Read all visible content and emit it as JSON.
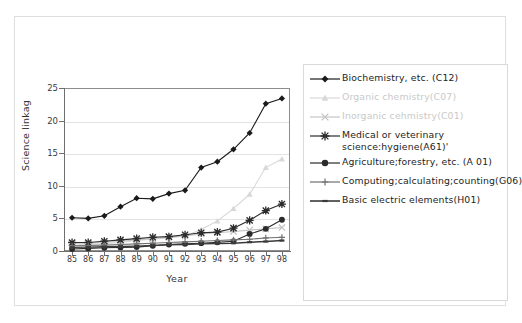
{
  "top_title_fragment": "",
  "chart_data": {
    "type": "line",
    "title": "",
    "xlabel": "Year",
    "ylabel": "Science linkag",
    "categories": [
      "85",
      "86",
      "87",
      "88",
      "89",
      "90",
      "91",
      "92",
      "93",
      "94",
      "95",
      "96",
      "97",
      "98"
    ],
    "ylim": [
      0,
      25
    ],
    "yticks": [
      0,
      5,
      10,
      15,
      20,
      25
    ],
    "grid": true,
    "legend_position": "right",
    "series": [
      {
        "name": "Biochemistry, etc. (C12)",
        "marker": "diamond",
        "color": "#1a1a1a",
        "values": [
          5.1,
          5.0,
          5.4,
          6.8,
          8.1,
          8.0,
          8.8,
          9.3,
          12.8,
          13.7,
          15.6,
          18.1,
          22.6,
          23.4
        ]
      },
      {
        "name": "Organic chemistry(C07)",
        "marker": "triangle",
        "color": "#d8d8d8",
        "values": [
          0.9,
          1.0,
          1.1,
          1.3,
          1.6,
          1.8,
          2.0,
          2.3,
          3.3,
          4.6,
          6.5,
          8.7,
          12.8,
          14.1
        ]
      },
      {
        "name": "Inorganic cehmistry(C01)",
        "marker": "cross",
        "color": "#c4c4c4",
        "values": [
          1.2,
          1.2,
          1.3,
          1.5,
          1.7,
          1.9,
          2.1,
          2.3,
          2.6,
          2.8,
          3.0,
          3.2,
          3.4,
          3.6
        ]
      },
      {
        "name": "Medical or veterinary science;hygiene(A61)'",
        "marker": "asterisk",
        "color": "#2b2b2b",
        "values": [
          1.3,
          1.3,
          1.5,
          1.7,
          1.9,
          2.1,
          2.2,
          2.5,
          2.8,
          2.9,
          3.5,
          4.7,
          6.2,
          7.2
        ]
      },
      {
        "name": "Agriculture;forestry, etc. (A01)",
        "marker": "circle",
        "color": "#2b2b2b",
        "values": [
          0.3,
          0.4,
          0.5,
          0.55,
          0.6,
          0.8,
          1.0,
          1.1,
          1.2,
          1.35,
          1.5,
          2.6,
          3.4,
          4.8
        ]
      },
      {
        "name": "Computing;calculating;counting(G06)",
        "marker": "plus",
        "color": "#707070",
        "values": [
          0.8,
          0.85,
          0.9,
          1.0,
          1.1,
          1.2,
          1.3,
          1.4,
          1.5,
          1.6,
          1.7,
          1.8,
          2.0,
          2.1
        ]
      },
      {
        "name": "Basic electric elements(H01)",
        "marker": "dash",
        "color": "#3a3a3a",
        "values": [
          0.55,
          0.6,
          0.65,
          0.7,
          0.75,
          0.85,
          0.95,
          1.0,
          1.1,
          1.15,
          1.2,
          1.35,
          1.45,
          1.6
        ]
      }
    ]
  },
  "legend": {
    "items": [
      {
        "label": "Biochemistry, etc. (C12)",
        "light": false
      },
      {
        "label": "Organic chemistry(C07)",
        "light": true
      },
      {
        "label": "Inorganic cehmistry(C01)",
        "light": true
      },
      {
        "label": "Medical or veterinary science:hygiene(A61)'",
        "light": false
      },
      {
        "label": "Agriculture;forestry, etc. (A 01)",
        "light": false
      },
      {
        "label": "Computing;calculating;counting(G06)",
        "light": false
      },
      {
        "label": "Basic electric elements(H01)",
        "light": false
      }
    ]
  }
}
